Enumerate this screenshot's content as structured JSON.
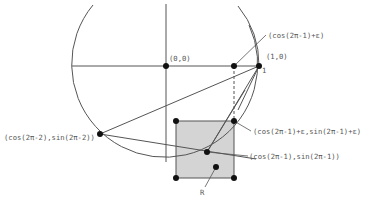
{
  "diagram": {
    "colors": {
      "line": "#555555",
      "point": "#111111",
      "square_fill": "#d4d4d4",
      "square_stroke": "#555555",
      "label": "#555555"
    },
    "labels": {
      "origin": "(0,0)",
      "one_zero": "(1,0)",
      "one_tick": "1",
      "cos_eps": "(cos(2π-1)+ε)",
      "point_2pi_minus_2": "(cos(2π-2),sin(2π-2))",
      "corner_top_right": "(cos(2π-1)+ε,sin(2π-1)+ε)",
      "point_2pi_minus_1": "(cos(2π-1),sin(2π-1))",
      "region_r": "R"
    }
  }
}
